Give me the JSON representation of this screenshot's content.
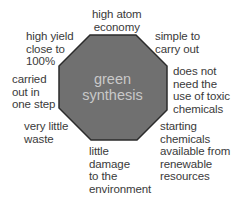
{
  "diagram": {
    "type": "concept-octagon",
    "center_label": "green\nsynthesis",
    "colors": {
      "octagon_fill": "#707070",
      "octagon_stroke": "#2b2b2b",
      "center_text": "#c9c9c9",
      "label_text": "#3a3a3a",
      "background": "#ffffff"
    },
    "labels": [
      {
        "id": "top",
        "text": "high atom\neconomy"
      },
      {
        "id": "top-right",
        "text": "simple to\ncarry out"
      },
      {
        "id": "right",
        "text": "does not\nneed the\nuse of toxic\nchemicals"
      },
      {
        "id": "bottom-right",
        "text": "starting\nchemicals\navailable from\nrenewable\nresources"
      },
      {
        "id": "bottom",
        "text": "little\ndamage\nto the\nenvironment"
      },
      {
        "id": "bottom-left",
        "text": "very little\nwaste"
      },
      {
        "id": "left",
        "text": "carried\nout in\none step"
      },
      {
        "id": "top-left",
        "text": "high yield\nclose to\n100%"
      }
    ]
  }
}
